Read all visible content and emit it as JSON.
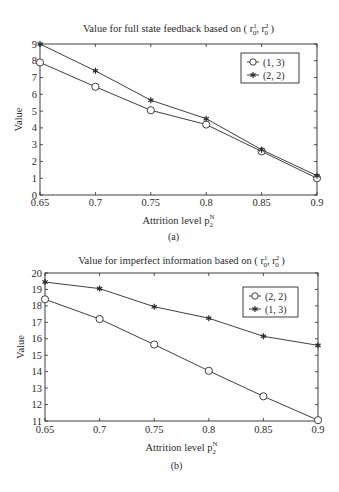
{
  "chart_data": [
    {
      "type": "line",
      "panel_label": "(a)",
      "title": "Value for full state feedback based on ( r",
      "title_parts": {
        "prefix": "Value for full state feedback based on ( ",
        "var1": "r",
        "sup1": "1",
        "sub1": "0",
        "sep": ", ",
        "var2": "r",
        "sup2": "2",
        "sub2": "0",
        "suffix": " )"
      },
      "xlabel": "Attrition level p",
      "xlabel_sup": "N",
      "xlabel_sub": "2",
      "ylabel": "Value",
      "x": [
        0.65,
        0.7,
        0.75,
        0.8,
        0.85,
        0.9
      ],
      "xticks": [
        "0.65",
        "0.7",
        "0.75",
        "0.8",
        "0.85",
        "0.9"
      ],
      "yticks": [
        "0",
        "1",
        "2",
        "3",
        "4",
        "5",
        "6",
        "7",
        "8",
        "9"
      ],
      "xlim": [
        0.65,
        0.9
      ],
      "ylim": [
        0,
        9
      ],
      "grid": false,
      "legend_position": "upper right",
      "series": [
        {
          "name": "(1, 3)",
          "marker": "circle",
          "values": [
            7.9,
            6.45,
            5.05,
            4.2,
            2.6,
            1.0
          ]
        },
        {
          "name": "(2, 2)",
          "marker": "star",
          "values": [
            9.0,
            7.4,
            5.65,
            4.55,
            2.7,
            1.15
          ]
        }
      ]
    },
    {
      "type": "line",
      "panel_label": "(b)",
      "title_parts": {
        "prefix": "Value for imperfect information based on ( ",
        "var1": "r",
        "sup1": "1",
        "sub1": "0",
        "sep": ", ",
        "var2": "r",
        "sup2": "2",
        "sub2": "0",
        "suffix": " )"
      },
      "xlabel": "Attrition level p",
      "xlabel_sup": "N",
      "xlabel_sub": "2",
      "ylabel": "Value",
      "x": [
        0.65,
        0.7,
        0.75,
        0.8,
        0.85,
        0.9
      ],
      "xticks": [
        "0.65",
        "0.7",
        "0.75",
        "0.8",
        "0.85",
        "0.9"
      ],
      "yticks": [
        "11",
        "12",
        "13",
        "14",
        "15",
        "16",
        "17",
        "18",
        "19",
        "20"
      ],
      "xlim": [
        0.65,
        0.9
      ],
      "ylim": [
        11,
        20
      ],
      "grid": false,
      "legend_position": "upper right",
      "series": [
        {
          "name": "(2, 2)",
          "marker": "circle",
          "values": [
            18.4,
            17.2,
            15.65,
            14.05,
            12.5,
            11.05
          ]
        },
        {
          "name": "(1, 3)",
          "marker": "star",
          "values": [
            19.45,
            19.05,
            17.95,
            17.25,
            16.15,
            15.6
          ]
        }
      ]
    }
  ],
  "colors": {
    "line": "#2a2a2a",
    "background": "#ffffff"
  }
}
